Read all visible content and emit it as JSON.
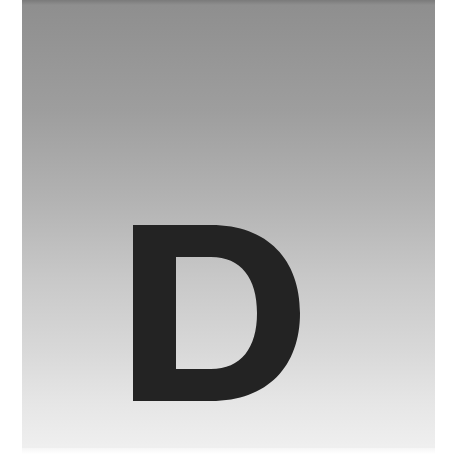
{
  "page": {
    "kind": "chapter-divider",
    "letter": "D",
    "colors": {
      "background": "#ffffff",
      "panel_top": "#8e8e8e",
      "panel_bottom": "#efefef",
      "letter": "#232323"
    }
  }
}
